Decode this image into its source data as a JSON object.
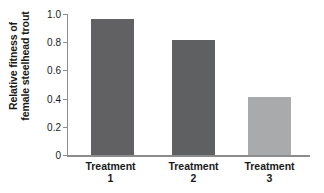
{
  "chart_data": {
    "type": "bar",
    "title": "",
    "xlabel": "",
    "ylabel_line1": "Relative fitness of",
    "ylabel_line2": "female steelhead trout",
    "categories": [
      "Treatment 1",
      "Treatment 2",
      "Treatment 3"
    ],
    "category_lines": [
      {
        "line1": "Treatment",
        "line2": "1"
      },
      {
        "line1": "Treatment",
        "line2": "2"
      },
      {
        "line1": "Treatment",
        "line2": "3"
      }
    ],
    "values": [
      1.01,
      0.86,
      0.43
    ],
    "ylim": [
      0,
      1.05
    ],
    "yticks": [
      "0",
      "0.2",
      "0.4",
      "0.6",
      "0.8",
      "1.0"
    ],
    "ytick_values": [
      0,
      0.2,
      0.4,
      0.6,
      0.8,
      1.0
    ],
    "grid": false,
    "legend": "none",
    "bar_colors": [
      "#616163",
      "#5f6062",
      "#a9aaac"
    ],
    "axis_color": "#8c8c8c"
  }
}
